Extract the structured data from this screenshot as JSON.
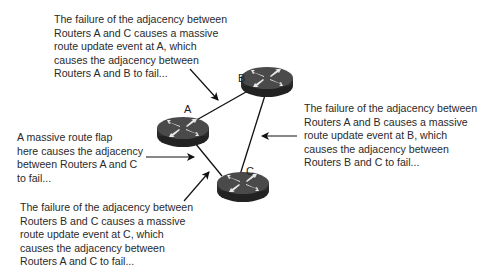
{
  "diagram": {
    "routers": [
      {
        "id": "A",
        "label": "A"
      },
      {
        "id": "B",
        "label": "B"
      },
      {
        "id": "C",
        "label": "C"
      }
    ],
    "links": [
      {
        "from": "A",
        "to": "B"
      },
      {
        "from": "A",
        "to": "C"
      },
      {
        "from": "B",
        "to": "C"
      }
    ],
    "annotations": {
      "top": "The failure of the adjacency between\nRouters A and C causes a massive\nroute update event at A, which\ncauses the adjacency between\nRouters A and B to fail...",
      "right": "The failure of the adjacency between\nRouters A and B causes a massive\nroute update event at B, which\ncauses the adjacency between\nRouters B and C to fail...",
      "left": "A massive route flap\nhere causes the adjacency\nbetween Routers A and C\nto fail...",
      "bottom": "The failure of the adjacency between\nRouters B and C causes a massive\nroute update event at C, which\ncauses the adjacency between\nRouters A and C to fail..."
    },
    "colors": {
      "router_body": "#2b2b2b",
      "router_top": "#4a4a4a",
      "line": "#111111",
      "text": "#2a2a2a"
    }
  }
}
